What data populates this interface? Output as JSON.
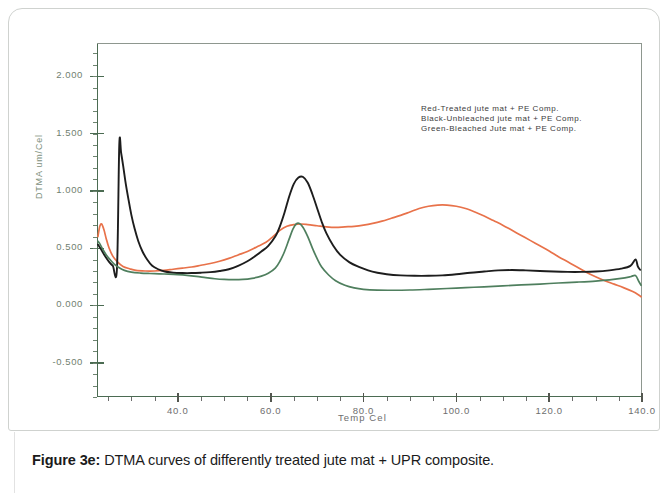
{
  "figure": {
    "caption_label": "Figure 3e:",
    "caption_text": " DTMA curves of differently treated jute mat + UPR composite."
  },
  "legend": {
    "lines": [
      "Red-Treated jute mat + PE Comp.",
      "Black-Unbleached jute mat + PE Comp.",
      "Green-Bleached Jute mat + PE Comp."
    ]
  },
  "axis": {
    "y_title": "DTMA um/Cel",
    "x_title": "Temp Cel",
    "y_ticks": [
      "2.000",
      "1.500",
      "1.000",
      "0.500",
      "0.000",
      "-0.500"
    ],
    "x_ticks": [
      "40.0",
      "60.0",
      "80.0",
      "100.0",
      "120.0",
      "140.0"
    ]
  },
  "colors": {
    "red": "#e8724a",
    "black": "#1d1d1d",
    "green": "#4f7f5e",
    "axis": "#4b6b52",
    "tick_text": "#70806f"
  },
  "chart_data": {
    "type": "line",
    "title": "",
    "xlabel": "Temp Cel",
    "ylabel": "DTMA um/Cel",
    "xlim": [
      22.6,
      140.0
    ],
    "ylim": [
      -0.8,
      2.29
    ],
    "grid": false,
    "legend_position": "upper-right",
    "x_ticks": [
      40.0,
      60.0,
      80.0,
      100.0,
      120.0,
      140.0
    ],
    "y_ticks": [
      2.0,
      1.5,
      1.0,
      0.5,
      0.0,
      -0.5
    ],
    "series": [
      {
        "name": "Red-Treated jute mat + PE Comp.",
        "color": "#e8724a",
        "points": [
          [
            22.8,
            0.6
          ],
          [
            23.2,
            0.69
          ],
          [
            23.6,
            0.71
          ],
          [
            24.1,
            0.66
          ],
          [
            24.6,
            0.58
          ],
          [
            25.2,
            0.5
          ],
          [
            26.0,
            0.43
          ],
          [
            27.0,
            0.38
          ],
          [
            28.2,
            0.34
          ],
          [
            29.6,
            0.32
          ],
          [
            31.0,
            0.305
          ],
          [
            33.0,
            0.3
          ],
          [
            35.0,
            0.3
          ],
          [
            37.0,
            0.305
          ],
          [
            39.0,
            0.315
          ],
          [
            41.0,
            0.325
          ],
          [
            43.0,
            0.335
          ],
          [
            45.0,
            0.35
          ],
          [
            47.0,
            0.365
          ],
          [
            49.0,
            0.385
          ],
          [
            51.0,
            0.41
          ],
          [
            53.0,
            0.44
          ],
          [
            55.0,
            0.47
          ],
          [
            57.0,
            0.51
          ],
          [
            59.0,
            0.55
          ],
          [
            60.5,
            0.6
          ],
          [
            62.0,
            0.655
          ],
          [
            63.5,
            0.69
          ],
          [
            65.0,
            0.705
          ],
          [
            66.5,
            0.71
          ],
          [
            68.0,
            0.705
          ],
          [
            70.0,
            0.695
          ],
          [
            72.0,
            0.685
          ],
          [
            74.0,
            0.68
          ],
          [
            76.0,
            0.685
          ],
          [
            78.0,
            0.69
          ],
          [
            80.0,
            0.7
          ],
          [
            82.0,
            0.715
          ],
          [
            84.0,
            0.735
          ],
          [
            86.0,
            0.76
          ],
          [
            88.0,
            0.785
          ],
          [
            90.0,
            0.815
          ],
          [
            92.0,
            0.845
          ],
          [
            94.0,
            0.865
          ],
          [
            96.0,
            0.875
          ],
          [
            98.0,
            0.875
          ],
          [
            100.0,
            0.865
          ],
          [
            102.0,
            0.845
          ],
          [
            104.0,
            0.815
          ],
          [
            106.0,
            0.78
          ],
          [
            108.0,
            0.74
          ],
          [
            110.0,
            0.7
          ],
          [
            112.0,
            0.655
          ],
          [
            114.0,
            0.61
          ],
          [
            116.0,
            0.565
          ],
          [
            118.0,
            0.52
          ],
          [
            120.0,
            0.475
          ],
          [
            122.0,
            0.425
          ],
          [
            124.0,
            0.38
          ],
          [
            126.0,
            0.335
          ],
          [
            128.0,
            0.29
          ],
          [
            130.0,
            0.25
          ],
          [
            132.0,
            0.215
          ],
          [
            134.0,
            0.185
          ],
          [
            136.0,
            0.155
          ],
          [
            138.0,
            0.12
          ],
          [
            139.3,
            0.09
          ],
          [
            139.8,
            0.075
          ]
        ]
      },
      {
        "name": "Black-Unbleached jute mat + PE Comp.",
        "color": "#1d1d1d",
        "points": [
          [
            22.8,
            0.53
          ],
          [
            23.3,
            0.5
          ],
          [
            23.9,
            0.46
          ],
          [
            24.5,
            0.42
          ],
          [
            25.2,
            0.38
          ],
          [
            26.0,
            0.345
          ],
          [
            26.9,
            0.32
          ],
          [
            27.4,
            1.4
          ],
          [
            27.8,
            1.33
          ],
          [
            28.3,
            1.2
          ],
          [
            28.8,
            1.06
          ],
          [
            29.4,
            0.92
          ],
          [
            30.0,
            0.79
          ],
          [
            30.7,
            0.67
          ],
          [
            31.5,
            0.56
          ],
          [
            32.4,
            0.47
          ],
          [
            33.4,
            0.4
          ],
          [
            34.5,
            0.345
          ],
          [
            35.8,
            0.315
          ],
          [
            37.2,
            0.295
          ],
          [
            39.0,
            0.285
          ],
          [
            41.0,
            0.282
          ],
          [
            43.0,
            0.282
          ],
          [
            45.0,
            0.285
          ],
          [
            47.0,
            0.29
          ],
          [
            49.0,
            0.3
          ],
          [
            51.0,
            0.315
          ],
          [
            53.0,
            0.345
          ],
          [
            55.0,
            0.385
          ],
          [
            56.5,
            0.425
          ],
          [
            58.0,
            0.47
          ],
          [
            59.5,
            0.52
          ],
          [
            61.0,
            0.6
          ],
          [
            62.0,
            0.69
          ],
          [
            63.0,
            0.81
          ],
          [
            64.0,
            0.95
          ],
          [
            65.0,
            1.06
          ],
          [
            66.0,
            1.115
          ],
          [
            67.0,
            1.12
          ],
          [
            68.0,
            1.07
          ],
          [
            69.0,
            0.97
          ],
          [
            70.0,
            0.85
          ],
          [
            71.0,
            0.73
          ],
          [
            72.0,
            0.63
          ],
          [
            73.5,
            0.52
          ],
          [
            75.0,
            0.44
          ],
          [
            77.0,
            0.375
          ],
          [
            79.0,
            0.335
          ],
          [
            81.0,
            0.305
          ],
          [
            83.0,
            0.285
          ],
          [
            85.0,
            0.272
          ],
          [
            88.0,
            0.262
          ],
          [
            91.0,
            0.258
          ],
          [
            94.0,
            0.258
          ],
          [
            97.0,
            0.262
          ],
          [
            100.0,
            0.272
          ],
          [
            103.0,
            0.285
          ],
          [
            106.0,
            0.295
          ],
          [
            109.0,
            0.305
          ],
          [
            112.0,
            0.308
          ],
          [
            115.0,
            0.305
          ],
          [
            118.0,
            0.3
          ],
          [
            121.0,
            0.295
          ],
          [
            124.0,
            0.292
          ],
          [
            127.0,
            0.292
          ],
          [
            130.0,
            0.295
          ],
          [
            133.0,
            0.305
          ],
          [
            135.5,
            0.32
          ],
          [
            137.5,
            0.345
          ],
          [
            138.6,
            0.4
          ],
          [
            139.1,
            0.34
          ],
          [
            139.6,
            0.31
          ]
        ]
      },
      {
        "name": "Green-Bleached Jute mat + PE Comp.",
        "color": "#4f7f5e",
        "points": [
          [
            22.8,
            0.56
          ],
          [
            23.3,
            0.53
          ],
          [
            23.9,
            0.485
          ],
          [
            24.6,
            0.44
          ],
          [
            25.4,
            0.4
          ],
          [
            26.3,
            0.36
          ],
          [
            27.3,
            0.33
          ],
          [
            28.5,
            0.305
          ],
          [
            30.0,
            0.29
          ],
          [
            32.0,
            0.282
          ],
          [
            34.0,
            0.278
          ],
          [
            36.0,
            0.275
          ],
          [
            38.0,
            0.272
          ],
          [
            40.0,
            0.268
          ],
          [
            42.0,
            0.262
          ],
          [
            44.0,
            0.253
          ],
          [
            46.0,
            0.242
          ],
          [
            48.0,
            0.232
          ],
          [
            50.0,
            0.226
          ],
          [
            52.0,
            0.224
          ],
          [
            54.0,
            0.226
          ],
          [
            56.0,
            0.236
          ],
          [
            58.0,
            0.255
          ],
          [
            59.5,
            0.28
          ],
          [
            61.0,
            0.325
          ],
          [
            62.0,
            0.385
          ],
          [
            63.0,
            0.47
          ],
          [
            64.0,
            0.58
          ],
          [
            64.8,
            0.665
          ],
          [
            65.5,
            0.71
          ],
          [
            66.2,
            0.715
          ],
          [
            67.0,
            0.68
          ],
          [
            68.0,
            0.6
          ],
          [
            69.0,
            0.5
          ],
          [
            70.0,
            0.41
          ],
          [
            71.0,
            0.335
          ],
          [
            72.5,
            0.265
          ],
          [
            74.0,
            0.215
          ],
          [
            76.0,
            0.175
          ],
          [
            78.0,
            0.152
          ],
          [
            80.0,
            0.14
          ],
          [
            83.0,
            0.133
          ],
          [
            86.0,
            0.132
          ],
          [
            90.0,
            0.134
          ],
          [
            94.0,
            0.14
          ],
          [
            98.0,
            0.147
          ],
          [
            102.0,
            0.155
          ],
          [
            106.0,
            0.162
          ],
          [
            110.0,
            0.17
          ],
          [
            114.0,
            0.178
          ],
          [
            118.0,
            0.186
          ],
          [
            122.0,
            0.195
          ],
          [
            126.0,
            0.203
          ],
          [
            130.0,
            0.212
          ],
          [
            133.0,
            0.222
          ],
          [
            135.5,
            0.235
          ],
          [
            137.5,
            0.25
          ],
          [
            138.6,
            0.26
          ],
          [
            139.3,
            0.21
          ],
          [
            139.8,
            0.175
          ]
        ]
      }
    ]
  }
}
